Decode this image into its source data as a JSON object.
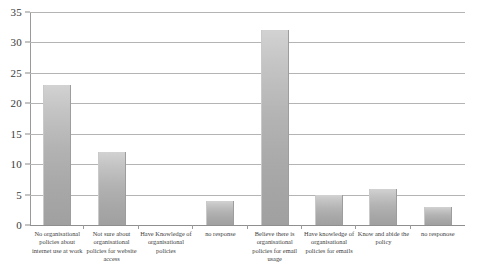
{
  "chart_data": {
    "type": "bar",
    "title": "",
    "subtitle": "",
    "xlabel": "",
    "ylabel": "",
    "ylim": [
      0,
      35
    ],
    "y_ticks": [
      0,
      5,
      10,
      15,
      20,
      25,
      30,
      35
    ],
    "grid": true,
    "legend": false,
    "legend_position": "none",
    "bar_color": "#b3b3b3",
    "gridline_color": "#b4b4b4",
    "axis_color": "#8f8f8f",
    "text_color": "#404040",
    "categories": [
      "No organisational policies about internet use at work",
      "Not sure about organisational policies for website access",
      "Have Knowledge of organisational policies",
      "no response",
      "Believe there is organisational policies for email usage",
      "Have knowledge of organisational policies for emails",
      "Know and abide the policy",
      "no responose"
    ],
    "values": [
      23,
      12,
      0,
      4,
      32,
      5,
      6,
      3
    ],
    "series": [
      {
        "name": "Responses",
        "values": [
          23,
          12,
          0,
          4,
          32,
          5,
          6,
          3
        ]
      }
    ]
  }
}
